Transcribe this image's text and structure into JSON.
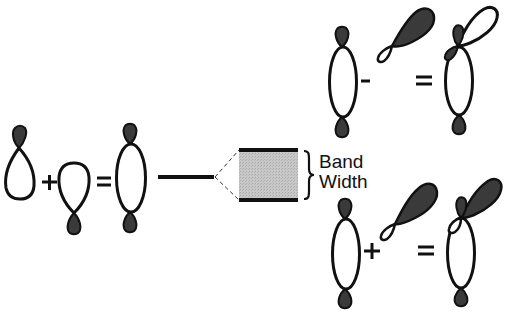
{
  "figure": {
    "type": "molecular-orbital-band-diagram",
    "colors": {
      "stroke": "#111111",
      "phase_filled": "#3a3a3a",
      "phase_open": "#ffffff",
      "band_fill": "#c4c4c4",
      "background": "#ffffff"
    }
  },
  "left_combination": {
    "operators": [
      "+",
      "="
    ],
    "terms": [
      "sp-orbital-up",
      "sp-orbital-down",
      "sigma-combined-orbital"
    ]
  },
  "band": {
    "label_line1": "Band",
    "label_line2": "Width"
  },
  "top_right_combination": {
    "operators": [
      "-",
      "="
    ],
    "terms": [
      "sigma-orbital",
      "tilted-p-orbital",
      "antibonding-mixed-orbital"
    ]
  },
  "bottom_right_combination": {
    "operators": [
      "+",
      "="
    ],
    "terms": [
      "sigma-orbital",
      "tilted-p-orbital",
      "bonding-mixed-orbital"
    ]
  }
}
